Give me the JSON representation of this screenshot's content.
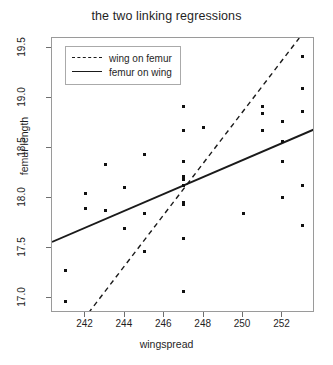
{
  "chart_data": {
    "type": "scatter",
    "title": "the two linking regressions",
    "xlabel": "wingspread",
    "ylabel": "femur length",
    "xlim": [
      240.3,
      253.65
    ],
    "ylim": [
      16.85,
      19.6
    ],
    "xticks": [
      242,
      244,
      246,
      248,
      250,
      252
    ],
    "yticks": [
      "17.0",
      "17.5",
      "18.0",
      "18.5",
      "19.0",
      "19.5"
    ],
    "grid": false,
    "legend_position": "top-left",
    "legend": [
      {
        "label": "wing on femur",
        "style": "dashed"
      },
      {
        "label": "femur on wing",
        "style": "solid"
      }
    ],
    "points": [
      [
        241.0,
        17.28
      ],
      [
        241.0,
        16.97
      ],
      [
        242.0,
        18.05
      ],
      [
        242.0,
        17.9
      ],
      [
        243.0,
        18.34
      ],
      [
        243.0,
        17.88
      ],
      [
        244.0,
        18.11
      ],
      [
        244.0,
        17.7
      ],
      [
        245.0,
        18.44
      ],
      [
        245.0,
        17.85
      ],
      [
        245.0,
        17.47
      ],
      [
        247.0,
        18.92
      ],
      [
        247.0,
        18.68
      ],
      [
        247.0,
        18.37
      ],
      [
        247.0,
        18.22
      ],
      [
        247.0,
        18.19
      ],
      [
        247.0,
        18.13
      ],
      [
        247.0,
        17.96
      ],
      [
        247.0,
        17.94
      ],
      [
        247.0,
        17.6
      ],
      [
        247.0,
        17.07
      ],
      [
        248.0,
        18.71
      ],
      [
        250.0,
        17.85
      ],
      [
        251.0,
        18.92
      ],
      [
        251.0,
        18.85
      ],
      [
        251.0,
        18.68
      ],
      [
        252.0,
        18.77
      ],
      [
        252.0,
        18.57
      ],
      [
        252.0,
        18.37
      ],
      [
        252.0,
        18.01
      ],
      [
        253.0,
        19.42
      ],
      [
        253.0,
        19.1
      ],
      [
        253.0,
        18.87
      ],
      [
        253.0,
        18.13
      ],
      [
        253.0,
        17.73
      ]
    ],
    "series": [
      {
        "name": "femur on wing",
        "style": "solid",
        "type": "line",
        "endpoints": [
          [
            240.3,
            17.56
          ],
          [
            253.65,
            18.69
          ]
        ]
      },
      {
        "name": "wing on femur",
        "style": "dashed",
        "type": "line",
        "endpoints": [
          [
            242.15,
            16.85
          ],
          [
            252.85,
            19.6
          ]
        ]
      }
    ],
    "colors": {
      "point": "#111111",
      "line": "#1a1a1a",
      "frame": "#9a9a9a"
    }
  }
}
